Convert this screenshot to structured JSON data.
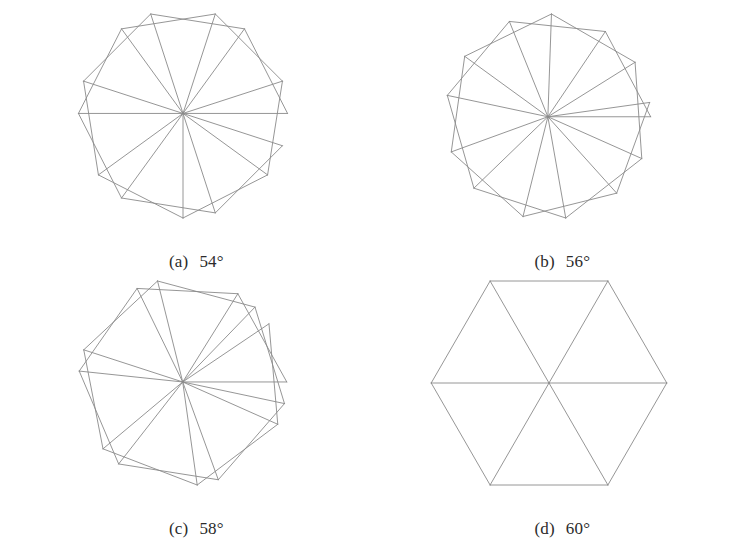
{
  "figure": {
    "background_color": "#ffffff",
    "stroke_color": "#8a8a8a",
    "stroke_width": 0.9,
    "panel_count": 4,
    "columns": 2,
    "rows": 2
  },
  "panels": [
    {
      "id": "a",
      "label": "(a)",
      "value": "54°",
      "caption": "(a)  54°",
      "angle_deg": 54,
      "position": "top-left"
    },
    {
      "id": "b",
      "label": "(b)",
      "value": "56°",
      "caption": "(b)  56°",
      "angle_deg": 56,
      "position": "top-right"
    },
    {
      "id": "c",
      "label": "(c)",
      "value": "58°",
      "caption": "(c)  58°",
      "angle_deg": 58,
      "position": "bottom-left"
    },
    {
      "id": "d",
      "label": "(d)",
      "value": "60°",
      "caption": "(d)  60°",
      "angle_deg": 60,
      "position": "bottom-right"
    }
  ],
  "chart_data": {
    "type": "diagram",
    "subtype": "spiral-tiling",
    "parameter_name": "apex angle",
    "parameter_unit": "degrees",
    "series": [
      {
        "name": "(a)",
        "angle_deg": 54,
        "iterations": 13
      },
      {
        "name": "(b)",
        "angle_deg": 56,
        "iterations": 13
      },
      {
        "name": "(c)",
        "angle_deg": 58,
        "iterations": 13
      },
      {
        "name": "(d)",
        "angle_deg": 60,
        "iterations": 13
      }
    ],
    "categories": [
      "54°",
      "56°",
      "58°",
      "60°"
    ],
    "values": [
      54,
      56,
      58,
      60
    ],
    "xlabel": "",
    "ylabel": "",
    "legend": "none",
    "grid": false
  }
}
